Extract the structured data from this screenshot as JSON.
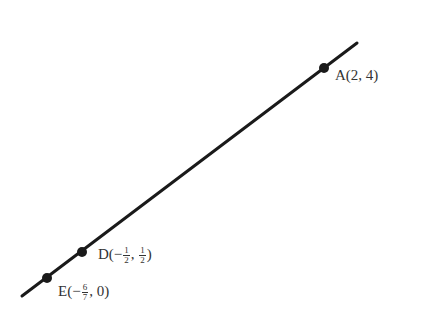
{
  "diagram": {
    "type": "line-through-points",
    "line_color": "#1a1a1a",
    "points": [
      {
        "name": "A",
        "label_text": "A(2, 4)",
        "x": 2,
        "y": 4
      },
      {
        "name": "D",
        "label_text": "D(−1/2, 1/2)",
        "x": "-1/2",
        "y": "1/2"
      },
      {
        "name": "E",
        "label_text": "E(−6/7, 0)",
        "x": "-6/7",
        "y": 0
      }
    ]
  },
  "labels": {
    "A": {
      "letter": "A",
      "open": "(",
      "x": "2",
      "sep": ", ",
      "y": "4",
      "close": ")"
    },
    "D": {
      "letter": "D",
      "open": "(−",
      "x_num": "1",
      "x_den": "2",
      "sep": ", ",
      "y_num": "1",
      "y_den": "2",
      "close": ")"
    },
    "E": {
      "letter": "E",
      "open": "(−",
      "x_num": "6",
      "x_den": "7",
      "sep": ", ",
      "y": "0",
      "close": ")"
    }
  }
}
